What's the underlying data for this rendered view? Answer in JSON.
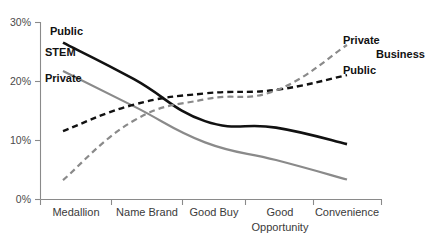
{
  "chart_data": {
    "type": "line",
    "title": "",
    "subtitle": "",
    "xlabel": "",
    "ylabel": "",
    "categories": [
      "Medallion",
      "Name Brand",
      "Good Buy",
      "Good Opportunity",
      "Convenience"
    ],
    "category_lines": [
      [
        "Medallion"
      ],
      [
        "Name",
        "Brand"
      ],
      [
        "Good",
        "Buy"
      ],
      [
        "Good",
        "Opportunity"
      ],
      [
        "Convenience"
      ]
    ],
    "ylim": [
      0,
      30
    ],
    "yticks": [
      0,
      10,
      20,
      30
    ],
    "ytick_labels": [
      "0%",
      "10%",
      "20%",
      "30%"
    ],
    "grid": false,
    "legend_position": "inline-endpoint-labels",
    "series": [
      {
        "name": "STEM Public",
        "group": "STEM",
        "label": "Public",
        "values": [
          26.5,
          20.3,
          13.2,
          12.1,
          9.3
        ],
        "color": "#111111",
        "style": "solid",
        "width": 2.6,
        "label_side": "left"
      },
      {
        "name": "STEM Private",
        "group": "STEM",
        "label": "Private",
        "values": [
          21.7,
          15.7,
          9.6,
          6.6,
          3.3
        ],
        "color": "#8a8a8a",
        "style": "solid",
        "width": 2.2,
        "label_side": "left"
      },
      {
        "name": "Business Public",
        "group": "Business",
        "label": "Public",
        "values": [
          11.5,
          16.0,
          17.9,
          18.5,
          21.0
        ],
        "color": "#111111",
        "style": "dashed",
        "width": 2.4,
        "label_side": "right"
      },
      {
        "name": "Business Private",
        "group": "Business",
        "label": "Private",
        "values": [
          3.2,
          13.3,
          16.9,
          18.4,
          26.1
        ],
        "color": "#8a8a8a",
        "style": "dashed",
        "width": 2.2,
        "label_side": "right"
      }
    ],
    "group_labels": [
      {
        "text": "STEM",
        "side": "left"
      },
      {
        "text": "Business",
        "side": "right"
      }
    ]
  },
  "labels": {
    "left_group": "STEM",
    "left_public": "Public",
    "left_private": "Private",
    "right_group": "Business",
    "right_public": "Public",
    "right_private": "Private"
  },
  "colors": {
    "black_series": "#111111",
    "gray_series": "#8a8a8a",
    "axis": "#8a8a8a",
    "tick_text": "#4a4a4a",
    "category_text": "#3a3a3a",
    "background": "#ffffff"
  }
}
